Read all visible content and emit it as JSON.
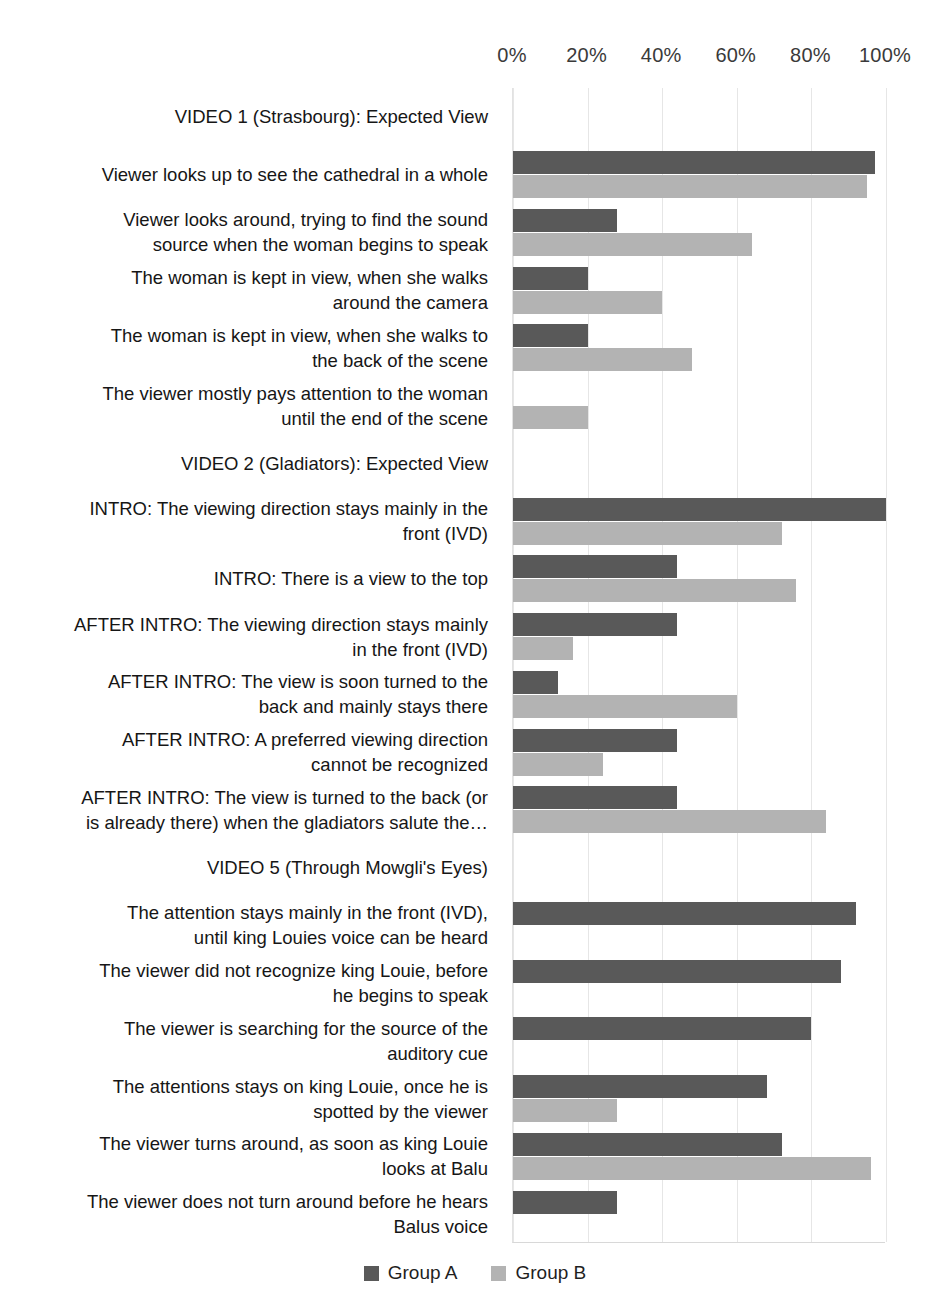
{
  "chart_data": {
    "type": "bar",
    "orientation": "horizontal",
    "title": "",
    "xlabel": "",
    "ylabel": "",
    "xlim": [
      0,
      100
    ],
    "xticks": [
      "0%",
      "20%",
      "40%",
      "60%",
      "80%",
      "100%"
    ],
    "xtick_values": [
      0,
      20,
      40,
      60,
      80,
      100
    ],
    "grid": true,
    "legend_position": "bottom",
    "series": [
      {
        "name": "Group A",
        "color": "#595959"
      },
      {
        "name": "Group B",
        "color": "#b3b3b3"
      }
    ],
    "categories": [
      "VIDEO 1 (Strasbourg): Expected View",
      "Viewer looks up to see the cathedral in a whole",
      "Viewer looks around, trying to find the sound\nsource when the woman begins to speak",
      "The woman is kept in view, when she walks\naround the camera",
      "The woman is kept in view, when she walks to\nthe back of the scene",
      "The viewer mostly pays attention to the woman\nuntil the end of the scene",
      "VIDEO 2 (Gladiators): Expected View",
      "INTRO: The viewing direction stays mainly in the\nfront (IVD)",
      "INTRO: There is a view to the top",
      "AFTER INTRO: The viewing direction stays mainly\nin the front (IVD)",
      "AFTER INTRO: The view is soon turned to the\nback and mainly stays there",
      "AFTER INTRO: A preferred viewing direction\ncannot be recognized",
      "AFTER INTRO: The view is turned to the back (or\nis already there) when the gladiators salute the…",
      "VIDEO 5 (Through Mowgli's Eyes)",
      "The attention stays mainly in the front (IVD),\nuntil king Louies voice can be heard",
      "The viewer did not recognize king Louie, before\nhe begins to speak",
      "The viewer is searching for the source of the\nauditory cue",
      "The attentions stays on king Louie, once he is\nspotted by the viewer",
      "The viewer turns around, as soon as king Louie\nlooks at Balu",
      "The viewer does not turn around before he hears\nBalus voice"
    ],
    "group_a_values": [
      0,
      97,
      28,
      20,
      20,
      0,
      0,
      100,
      44,
      44,
      12,
      44,
      44,
      0,
      92,
      88,
      80,
      68,
      72,
      28
    ],
    "group_b_values": [
      0,
      95,
      64,
      40,
      48,
      20,
      0,
      72,
      76,
      16,
      60,
      24,
      84,
      0,
      0,
      0,
      0,
      28,
      96,
      0
    ]
  },
  "legend": {
    "items": [
      {
        "label": "Group A",
        "color": "#595959"
      },
      {
        "label": "Group B",
        "color": "#b3b3b3"
      }
    ]
  }
}
